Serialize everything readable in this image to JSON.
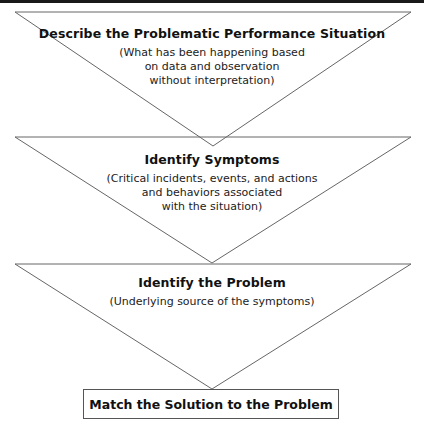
{
  "diagram": {
    "stages": [
      {
        "title": "Describe the Problematic Performance Situation",
        "description_lines": [
          "(What has been happening based",
          "on data and observation",
          "without interpretation)"
        ]
      },
      {
        "title": "Identify Symptoms",
        "description_lines": [
          "(Critical incidents, events, and actions",
          "and behaviors associated",
          "with the situation)"
        ]
      },
      {
        "title": "Identify the Problem",
        "description_lines": [
          "(Underlying source of the symptoms)"
        ]
      }
    ],
    "final_box": "Match the Solution to the Problem",
    "colors": {
      "stroke": "#666666",
      "topbar": "#1a1a1a",
      "background": "#ffffff"
    }
  }
}
